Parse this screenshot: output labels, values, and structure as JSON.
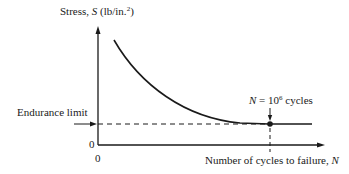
{
  "diagram": {
    "type": "S-N curve (stress vs. number of cycles to failure)",
    "y_axis": {
      "label_prefix": "Stress, ",
      "label_symbol": "S",
      "label_units_pre": " (lb/in.",
      "label_units_sup": "2",
      "label_units_post": ")",
      "origin_label": "0"
    },
    "x_axis": {
      "label_prefix": "Number of cycles to failure, ",
      "label_symbol": "N",
      "origin_label": "0"
    },
    "endurance_limit": {
      "label": "Endurance limit"
    },
    "annotation": {
      "symbol": "N",
      "equals": " = 10",
      "exponent": "6",
      "suffix": " cycles"
    },
    "colors": {
      "ink": "#1a1a1a",
      "background": "#ffffff"
    }
  }
}
